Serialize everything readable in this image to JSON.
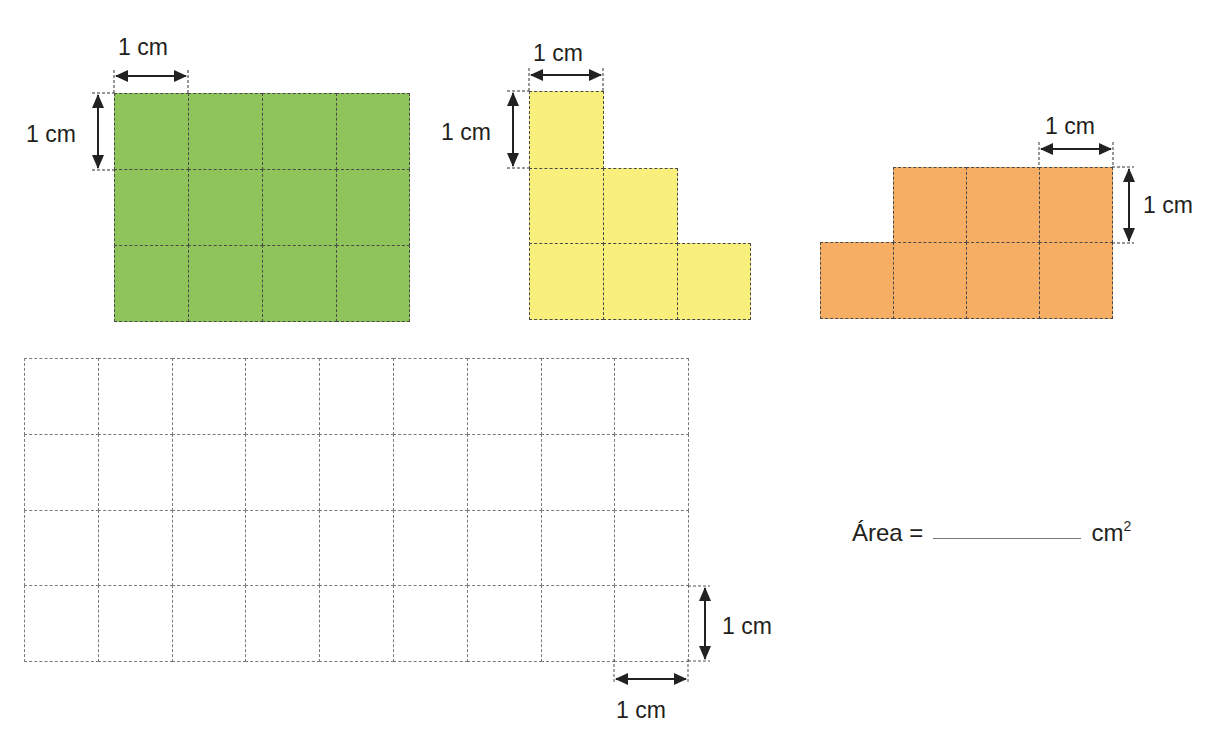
{
  "figure": {
    "unit_label": "1 cm",
    "colors": {
      "green": "#8fc45a",
      "yellow": "#f9ef7d",
      "orange": "#f5ae63",
      "grid_line": "#4a4a4a"
    },
    "shapes": [
      {
        "name": "green-rectangle",
        "color": "green",
        "columns": 4,
        "rows": 3,
        "cell_count": 12
      },
      {
        "name": "yellow-staircase",
        "color": "yellow",
        "row_lengths_top_to_bottom": [
          1,
          2,
          3
        ],
        "cell_count": 6
      },
      {
        "name": "orange-shape",
        "color": "orange",
        "row_lengths_top_to_bottom": [
          3,
          4
        ],
        "cell_count": 7
      }
    ],
    "grid": {
      "columns": 9,
      "rows": 4,
      "cell_count": 36
    }
  },
  "labels": {
    "green_width": "1 cm",
    "green_height": "1 cm",
    "yellow_width": "1 cm",
    "yellow_height": "1 cm",
    "orange_width": "1 cm",
    "orange_height": "1 cm",
    "grid_height": "1 cm",
    "grid_width": "1 cm"
  },
  "answer": {
    "prefix": "Área =",
    "blank": "",
    "unit": "cm",
    "exponent": "2"
  }
}
